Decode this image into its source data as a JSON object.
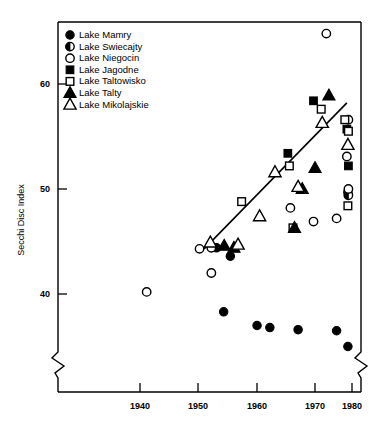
{
  "chart_data": {
    "type": "scatter",
    "title": "",
    "xlabel": "",
    "ylabel": "Secchi Disc Index",
    "xlim": [
      1933,
      1982
    ],
    "ylim": [
      33.5,
      66.5
    ],
    "grid": false,
    "legend_position": "top-left",
    "x_ticks": [
      1940,
      1950,
      1960,
      1970,
      1980
    ],
    "x_tick_labels": [
      "1940",
      "1950",
      "1960",
      "1970",
      "1980"
    ],
    "y_ticks": [
      40,
      50,
      60
    ],
    "y_tick_labels": [
      "40",
      "50",
      "60"
    ],
    "axis_break_x": true,
    "axis_break_y": true,
    "trend_line": {
      "x": [
        1951.2,
        1979.0
      ],
      "y": [
        44.3,
        58.2
      ]
    },
    "series": [
      {
        "name": "Lake Mamry",
        "marker": "filled-circle",
        "points": [
          {
            "x": 1953.6,
            "y": 44.4
          },
          {
            "x": 1956.3,
            "y": 43.6
          },
          {
            "x": 1955.0,
            "y": 38.3
          },
          {
            "x": 1961.5,
            "y": 37.0
          },
          {
            "x": 1964.0,
            "y": 36.8
          },
          {
            "x": 1969.5,
            "y": 36.6
          },
          {
            "x": 1977.0,
            "y": 36.5
          },
          {
            "x": 1979.2,
            "y": 49.7
          },
          {
            "x": 1979.2,
            "y": 35.0
          }
        ]
      },
      {
        "name": "Lake Swiecajty",
        "marker": "half-circle",
        "points": [
          {
            "x": 1979.3,
            "y": 49.4
          },
          {
            "x": 1979.3,
            "y": 56.6
          }
        ]
      },
      {
        "name": "Lake Niegocin",
        "marker": "open-circle",
        "points": [
          {
            "x": 1940.0,
            "y": 40.2
          },
          {
            "x": 1950.3,
            "y": 44.3
          },
          {
            "x": 1952.6,
            "y": 44.4
          },
          {
            "x": 1952.6,
            "y": 42.0
          },
          {
            "x": 1968.0,
            "y": 48.2
          },
          {
            "x": 1972.5,
            "y": 46.9
          },
          {
            "x": 1975.0,
            "y": 64.8
          },
          {
            "x": 1977.0,
            "y": 47.2
          },
          {
            "x": 1979.0,
            "y": 53.1
          },
          {
            "x": 1979.3,
            "y": 50.0
          }
        ]
      },
      {
        "name": "Lake Jagodne",
        "marker": "filled-square",
        "points": [
          {
            "x": 1967.5,
            "y": 53.4
          },
          {
            "x": 1972.5,
            "y": 58.4
          },
          {
            "x": 1979.0,
            "y": 55.7
          },
          {
            "x": 1979.3,
            "y": 52.2
          }
        ]
      },
      {
        "name": "Lake Taltowisko",
        "marker": "open-square",
        "points": [
          {
            "x": 1958.5,
            "y": 48.8
          },
          {
            "x": 1967.8,
            "y": 52.2
          },
          {
            "x": 1968.5,
            "y": 46.3
          },
          {
            "x": 1974.0,
            "y": 57.6
          },
          {
            "x": 1978.6,
            "y": 56.6
          },
          {
            "x": 1979.3,
            "y": 55.5
          },
          {
            "x": 1979.2,
            "y": 48.4
          }
        ]
      },
      {
        "name": "Lake Talty",
        "marker": "filled-triangle",
        "points": [
          {
            "x": 1955.1,
            "y": 44.6
          },
          {
            "x": 1957.0,
            "y": 44.4
          },
          {
            "x": 1968.8,
            "y": 46.3
          },
          {
            "x": 1970.3,
            "y": 50.0
          },
          {
            "x": 1972.8,
            "y": 52.0
          },
          {
            "x": 1975.5,
            "y": 58.9
          }
        ]
      },
      {
        "name": "Lake Mikolajskie",
        "marker": "open-triangle",
        "points": [
          {
            "x": 1952.4,
            "y": 44.9
          },
          {
            "x": 1957.8,
            "y": 44.7
          },
          {
            "x": 1962.0,
            "y": 47.4
          },
          {
            "x": 1965.0,
            "y": 51.6
          },
          {
            "x": 1969.5,
            "y": 50.2
          },
          {
            "x": 1974.2,
            "y": 56.3
          },
          {
            "x": 1979.2,
            "y": 54.2
          }
        ]
      }
    ]
  },
  "legend": {
    "items": [
      {
        "label": "Lake Mamry",
        "marker": "filled-circle"
      },
      {
        "label": "Lake Swiecajty",
        "marker": "half-circle"
      },
      {
        "label": "Lake Niegocin",
        "marker": "open-circle"
      },
      {
        "label": "Lake Jagodne",
        "marker": "filled-square"
      },
      {
        "label": "Lake Taltowisko",
        "marker": "open-square"
      },
      {
        "label": "Lake Talty",
        "marker": "filled-triangle"
      },
      {
        "label": "Lake Mikolajskie",
        "marker": "open-triangle"
      }
    ]
  }
}
